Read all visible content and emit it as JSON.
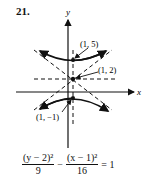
{
  "problem_number": "21.",
  "axes": {
    "x_label": "x",
    "y_label": "y"
  },
  "points": [
    {
      "label": "(1, 5)",
      "x": 1,
      "y": 5
    },
    {
      "label": "(1, 2)",
      "x": 1,
      "y": 2
    },
    {
      "label": "(1, −1)",
      "x": 1,
      "y": -1
    }
  ],
  "equation": {
    "term1_num": "(y − 2)²",
    "term1_den": "9",
    "minus": "−",
    "term2_num": "(x − 1)²",
    "term2_den": "16",
    "rhs": "= 1"
  },
  "colors": {
    "ink": "#111111"
  }
}
